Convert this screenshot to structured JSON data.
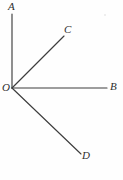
{
  "figure": {
    "background_color": "#fefefe",
    "stroke_color": "#3d3d3d",
    "label_color": "#2e2e2e",
    "vertex": {
      "name": "O",
      "label": "O",
      "x": 12,
      "y": 88
    },
    "rays": [
      {
        "name": "ray-OA",
        "label": "A",
        "from_x": 12,
        "from_y": 88,
        "to_x": 12,
        "to_y": 14
      },
      {
        "name": "ray-OC",
        "label": "C",
        "from_x": 12,
        "from_y": 88,
        "to_x": 64,
        "to_y": 36
      },
      {
        "name": "ray-OB",
        "label": "B",
        "from_x": 12,
        "from_y": 88,
        "to_x": 107,
        "to_y": 88
      },
      {
        "name": "ray-OD",
        "label": "D",
        "from_x": 12,
        "from_y": 88,
        "to_x": 81,
        "to_y": 154
      }
    ]
  }
}
